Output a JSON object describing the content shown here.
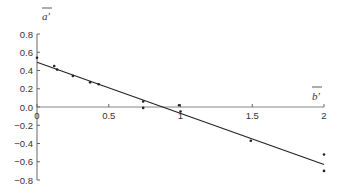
{
  "chart_data": {
    "type": "scatter",
    "title": "",
    "xlabel": "b′ (overlined)",
    "ylabel": "a′ (overlined)",
    "xlabel_text": "b′",
    "ylabel_text": "a′",
    "xlim": [
      0,
      2
    ],
    "ylim": [
      -0.8,
      0.8
    ],
    "x_ticks": [
      0,
      0.5,
      1,
      1.5,
      2
    ],
    "x_tick_labels": [
      "0",
      "0.5",
      "1",
      "1.5",
      "2"
    ],
    "y_ticks": [
      0.8,
      0.6,
      0.4,
      0.2,
      0.0,
      -0.2,
      -0.4,
      -0.6,
      -0.8
    ],
    "y_tick_labels": [
      "0.8",
      "0.6",
      "0.4",
      "0.2",
      "0.0",
      "−0.2",
      "−0.4",
      "−0.6",
      "−0.8"
    ],
    "grid": false,
    "legend": null,
    "series": [
      {
        "name": "data points",
        "kind": "scatter",
        "points": [
          {
            "x": 0.0,
            "y": 0.54
          },
          {
            "x": 0.12,
            "y": 0.45
          },
          {
            "x": 0.14,
            "y": 0.41
          },
          {
            "x": 0.25,
            "y": 0.34
          },
          {
            "x": 0.37,
            "y": 0.27
          },
          {
            "x": 0.43,
            "y": 0.25
          },
          {
            "x": 0.74,
            "y": 0.06
          },
          {
            "x": 0.74,
            "y": -0.01
          },
          {
            "x": 0.99,
            "y": 0.02
          },
          {
            "x": 1.0,
            "y": -0.05
          },
          {
            "x": 1.49,
            "y": -0.37
          },
          {
            "x": 2.0,
            "y": -0.52
          },
          {
            "x": 2.0,
            "y": -0.7
          }
        ]
      },
      {
        "name": "linear fit",
        "kind": "line",
        "points": [
          {
            "x": 0.0,
            "y": 0.49
          },
          {
            "x": 2.0,
            "y": -0.63
          }
        ]
      }
    ]
  }
}
